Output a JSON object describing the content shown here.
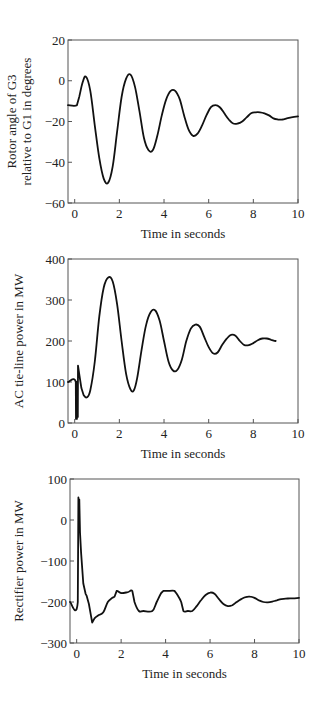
{
  "chart_data": [
    {
      "type": "line",
      "title": "",
      "xlabel": "Time in seconds",
      "ylabel": [
        "Rotor angle of G3",
        "relative to G1 in degrees"
      ],
      "xlim": [
        -0.3,
        10
      ],
      "ylim": [
        -60,
        20
      ],
      "xticks": [
        0,
        2,
        4,
        6,
        8,
        10
      ],
      "yticks": [
        20,
        0,
        -20,
        -40,
        -60
      ],
      "grid": false,
      "legend": null,
      "frame": {
        "left": 68,
        "top": 40,
        "right": 298,
        "bottom": 203
      },
      "series": [
        {
          "name": "Rotor angle G3-G1",
          "x": [
            -0.3,
            0.1,
            0.2,
            0.35,
            0.5,
            0.7,
            0.9,
            1.1,
            1.3,
            1.5,
            1.7,
            1.9,
            2.1,
            2.3,
            2.5,
            2.7,
            2.9,
            3.1,
            3.3,
            3.5,
            3.7,
            3.9,
            4.1,
            4.3,
            4.5,
            4.7,
            4.9,
            5.1,
            5.3,
            5.5,
            5.7,
            5.9,
            6.1,
            6.3,
            6.5,
            6.7,
            6.9,
            7.1,
            7.3,
            7.5,
            7.7,
            7.9,
            8.1,
            8.3,
            8.5,
            8.7,
            8.9,
            9.1,
            9.3,
            9.5,
            9.7,
            10.0
          ],
          "values": [
            -12,
            -12,
            -8,
            -1,
            2,
            -5,
            -22,
            -38,
            -48,
            -50,
            -42,
            -25,
            -8,
            1,
            3,
            -3,
            -15,
            -28,
            -34,
            -34,
            -27,
            -17,
            -9,
            -5,
            -5,
            -9,
            -17,
            -24,
            -27,
            -26,
            -22,
            -17,
            -13,
            -12,
            -13,
            -16,
            -19,
            -21,
            -21,
            -20,
            -18,
            -16,
            -15.5,
            -15.5,
            -16,
            -17,
            -18.5,
            -19,
            -19,
            -18.5,
            -18,
            -17.5
          ]
        }
      ]
    },
    {
      "type": "line",
      "title": "",
      "xlabel": "Time in seconds",
      "ylabel": [
        "AC tie-line power in MW"
      ],
      "xlim": [
        -0.3,
        10
      ],
      "ylim": [
        0,
        400
      ],
      "xticks": [
        0,
        2,
        4,
        6,
        8,
        10
      ],
      "yticks": [
        400,
        300,
        200,
        100,
        0
      ],
      "grid": false,
      "legend": null,
      "frame": {
        "left": 68,
        "top": 259,
        "right": 298,
        "bottom": 423
      },
      "series": [
        {
          "name": "AC tie-line power",
          "x": [
            -0.3,
            0.05,
            0.06,
            0.08,
            0.1,
            0.12,
            0.14,
            0.15,
            0.2,
            0.3,
            0.4,
            0.55,
            0.7,
            0.9,
            1.1,
            1.3,
            1.5,
            1.7,
            1.9,
            2.1,
            2.3,
            2.5,
            2.65,
            2.8,
            3.0,
            3.2,
            3.4,
            3.6,
            3.8,
            4.0,
            4.2,
            4.4,
            4.6,
            4.8,
            5.0,
            5.2,
            5.4,
            5.6,
            5.8,
            6.0,
            6.2,
            6.4,
            6.6,
            6.8,
            7.0,
            7.2,
            7.4,
            7.6,
            7.8,
            8.0,
            8.2,
            8.4,
            8.6,
            8.8,
            9.0,
            9.2,
            9.4,
            9.6,
            9.8,
            10.0
          ],
          "values": [
            100,
            100,
            10,
            100,
            10,
            100,
            15,
            140,
            120,
            85,
            68,
            63,
            80,
            150,
            260,
            330,
            355,
            345,
            290,
            200,
            120,
            82,
            80,
            110,
            180,
            240,
            270,
            275,
            250,
            200,
            150,
            128,
            130,
            155,
            200,
            230,
            240,
            235,
            210,
            185,
            170,
            172,
            190,
            205,
            215,
            213,
            200,
            190,
            190,
            195,
            202,
            206,
            206,
            203,
            200,
            200
          ]
        }
      ]
    },
    {
      "type": "line",
      "title": "",
      "xlabel": "Time in seconds",
      "ylabel": [
        "Rectifier power in MW"
      ],
      "xlim": [
        -0.3,
        10
      ],
      "ylim": [
        -300,
        100
      ],
      "xticks": [
        0,
        2,
        4,
        6,
        8,
        10
      ],
      "yticks": [
        100,
        0,
        -100,
        -200,
        -300
      ],
      "grid": false,
      "legend": null,
      "frame": {
        "left": 70,
        "top": 479,
        "right": 299,
        "bottom": 643
      },
      "series": [
        {
          "name": "Rectifier power",
          "x": [
            -0.3,
            0.05,
            0.08,
            0.1,
            0.12,
            0.15,
            0.2,
            0.3,
            0.4,
            0.45,
            0.55,
            0.65,
            0.7,
            0.8,
            1.0,
            1.2,
            1.4,
            1.6,
            1.7,
            1.8,
            2.0,
            2.3,
            2.5,
            2.6,
            2.8,
            3.0,
            3.4,
            3.6,
            3.8,
            3.9,
            4.1,
            4.4,
            4.5,
            4.7,
            4.8,
            5.0,
            5.2,
            5.4,
            5.6,
            5.8,
            6.0,
            6.2,
            6.4,
            6.6,
            6.8,
            7.0,
            7.2,
            7.4,
            7.6,
            7.8,
            8.0,
            8.2,
            8.4,
            8.6,
            8.8,
            9.0,
            9.2,
            9.4,
            9.6,
            9.8,
            10.0
          ],
          "values": [
            -200,
            -200,
            55,
            0,
            50,
            -30,
            -80,
            -155,
            -180,
            -185,
            -205,
            -235,
            -250,
            -240,
            -232,
            -225,
            -200,
            -190,
            -187,
            -173,
            -178,
            -176,
            -173,
            -200,
            -222,
            -222,
            -222,
            -200,
            -178,
            -173,
            -173,
            -173,
            -180,
            -200,
            -222,
            -222,
            -222,
            -210,
            -195,
            -183,
            -177,
            -180,
            -193,
            -205,
            -210,
            -208,
            -200,
            -193,
            -188,
            -187,
            -190,
            -196,
            -200,
            -201,
            -199,
            -196,
            -193,
            -192,
            -191,
            -191,
            -190
          ]
        }
      ]
    }
  ]
}
